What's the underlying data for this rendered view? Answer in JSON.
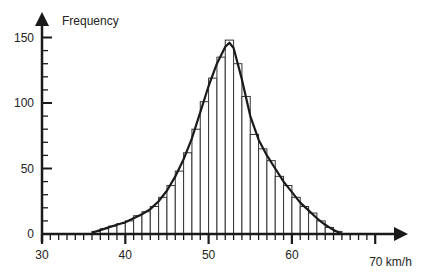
{
  "chart_data": {
    "type": "bar",
    "subtype": "histogram-with-fitted-curve",
    "title": "",
    "ylabel": "Frequency",
    "xlabel": "km/h",
    "xlim": [
      30,
      72
    ],
    "ylim": [
      0,
      150
    ],
    "x_major_ticks": [
      30,
      40,
      50,
      60,
      70
    ],
    "x_tick_labels": [
      "30",
      "40",
      "50",
      "60",
      "70 km/h"
    ],
    "x_minor_step": 1,
    "y_major_ticks": [
      0,
      50,
      100,
      150
    ],
    "y_tick_labels": [
      "0",
      "50",
      "100",
      "150"
    ],
    "y_minor_step": 10,
    "grid": false,
    "bin_width": 1,
    "bin_starts": [
      36,
      37,
      38,
      39,
      40,
      41,
      42,
      43,
      44,
      45,
      46,
      47,
      48,
      49,
      50,
      51,
      52,
      53,
      54,
      55,
      56,
      57,
      58,
      59,
      60,
      61,
      62,
      63,
      64,
      65
    ],
    "values": [
      2,
      4,
      6,
      8,
      10,
      14,
      17,
      21,
      28,
      37,
      48,
      62,
      80,
      101,
      119,
      135,
      148,
      130,
      105,
      76,
      65,
      56,
      44,
      37,
      28,
      21,
      16,
      10,
      5,
      2
    ],
    "curve": {
      "description": "smooth fitted distribution curve over histogram",
      "x": [
        36,
        37,
        38,
        39,
        40,
        41,
        42,
        43,
        44,
        45,
        46,
        47,
        48,
        49,
        50,
        51,
        52,
        52.5,
        53,
        54,
        55,
        56,
        57,
        58,
        59,
        60,
        61,
        62,
        63,
        64,
        65,
        66
      ],
      "y": [
        1,
        3,
        5,
        7,
        9,
        12,
        15,
        19,
        25,
        33,
        44,
        57,
        73,
        93,
        113,
        130,
        143,
        146,
        142,
        118,
        90,
        72,
        60,
        50,
        40,
        32,
        24,
        18,
        12,
        7,
        3,
        0
      ]
    }
  }
}
